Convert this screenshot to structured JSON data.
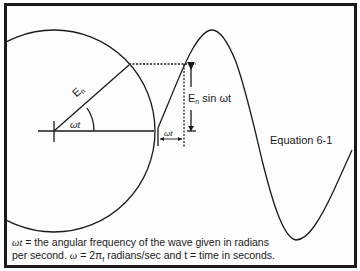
{
  "labels": {
    "radius": "E",
    "radius_sub": "n",
    "angle": "ωt",
    "amplitude_main": "E",
    "amplitude_sub": "n",
    "amplitude_rest": " sin ωt",
    "phase": "ωt",
    "equation": "Equation 6-1"
  },
  "caption": {
    "line1_symbol": "ωt",
    "line1_text": " = the angular frequency of the wave given in radians",
    "line2_prefix": "per second. ",
    "line2_symbol": "ω",
    "line2_middle": " = 2π",
    "line2_sub": "f",
    "line2_rest": " radians/sec and t = time in seconds."
  },
  "colors": {
    "ink": "#1a1a1a",
    "paper": "#fdfdfd"
  }
}
